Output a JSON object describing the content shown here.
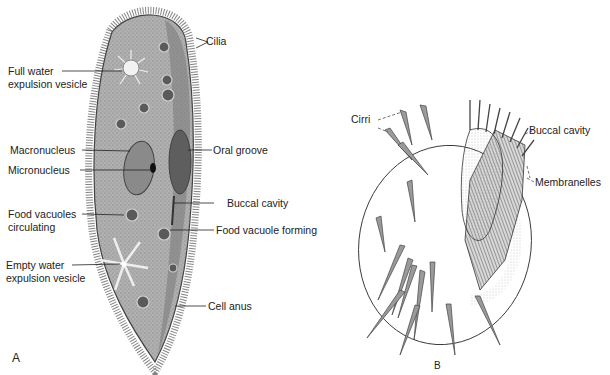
{
  "figure": {
    "panel_a": {
      "letter": "A",
      "organism": "Paramecium",
      "labels": {
        "cilia": "Cilia",
        "full_vesicle_1": "Full water",
        "full_vesicle_2": "expulsion vesicle",
        "macronucleus": "Macronucleus",
        "micronucleus": "Micronucleus",
        "oral_groove": "Oral groove",
        "buccal_cavity": "Buccal cavity",
        "food_vac_circ_1": "Food vacuoles",
        "food_vac_circ_2": "circulating",
        "food_vac_forming": "Food vacuole forming",
        "empty_vesicle_1": "Empty water",
        "empty_vesicle_2": "expulsion vesicle",
        "cell_anus": "Cell anus"
      }
    },
    "panel_b": {
      "letter": "B",
      "organism": "Hypotrich ciliate",
      "labels": {
        "cirri": "Cirri",
        "buccal_cavity": "Buccal cavity",
        "membranelles": "Membranelles"
      }
    },
    "colors": {
      "ink": "#222222",
      "cell_fill": "#a9a9a9",
      "cell_dark": "#6f6f6f",
      "background": "#ffffff"
    }
  }
}
